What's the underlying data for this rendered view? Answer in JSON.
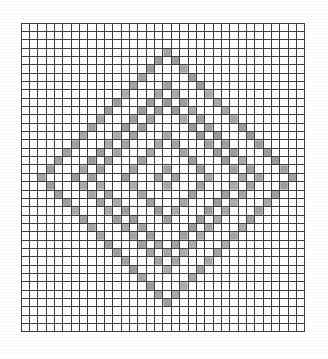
{
  "document": {
    "kind": "cross-stitch-pattern-chart",
    "title": "Diamond lattice cross-stitch chart",
    "background_color": "#ffffff"
  },
  "grid": {
    "columns": 34,
    "rows": 37,
    "cell_size_px": 8.35,
    "origin_x_px": 21,
    "origin_y_px": 23,
    "line_color": "#2b2b2b",
    "line_width_px": 1,
    "empty_cell_color": "#ffffff",
    "filled_cell_color": "#9b9b9b"
  },
  "legend": {
    "filled_symbol_name": "filled-stitch-cell",
    "filled_color": "#9b9b9b",
    "empty_symbol_name": "empty-stitch-cell",
    "empty_color": "#ffffff"
  },
  "chart_data": {
    "type": "heatmap",
    "title": "Diamond lattice cross-stitch chart",
    "xlabel": "",
    "ylabel": "",
    "grid": true,
    "legend_position": "none",
    "categories": [
      "empty",
      "filled"
    ],
    "values_color_map": {
      "0": "#ffffff",
      "1": "#9b9b9b"
    },
    "columns": 34,
    "rows": 37,
    "center_column": 17,
    "center_row": 18,
    "motif": "four nested diamond outlines rendered as checkerboard bands",
    "rings": [
      {
        "name": "outer-ring",
        "radius_cells": 16,
        "band_thickness_cells": 3,
        "style": "checkerboard"
      },
      {
        "name": "second-ring",
        "radius_cells": 11,
        "band_thickness_cells": 3,
        "style": "checkerboard"
      },
      {
        "name": "third-ring",
        "radius_cells": 6,
        "band_thickness_cells": 3,
        "style": "checkerboard"
      },
      {
        "name": "inner-ring",
        "radius_cells": 2,
        "band_thickness_cells": 2,
        "style": "checkerboard"
      }
    ],
    "x": [
      0,
      1,
      2,
      3,
      4,
      5,
      6,
      7,
      8,
      9,
      10,
      11,
      12,
      13,
      14,
      15,
      16,
      17,
      18,
      19,
      20,
      21,
      22,
      23,
      24,
      25,
      26,
      27,
      28,
      29,
      30,
      31,
      32,
      33
    ],
    "y": [
      0,
      1,
      2,
      3,
      4,
      5,
      6,
      7,
      8,
      9,
      10,
      11,
      12,
      13,
      14,
      15,
      16,
      17,
      18,
      19,
      20,
      21,
      22,
      23,
      24,
      25,
      26,
      27,
      28,
      29,
      30,
      31,
      32,
      33,
      34,
      35,
      36
    ]
  }
}
